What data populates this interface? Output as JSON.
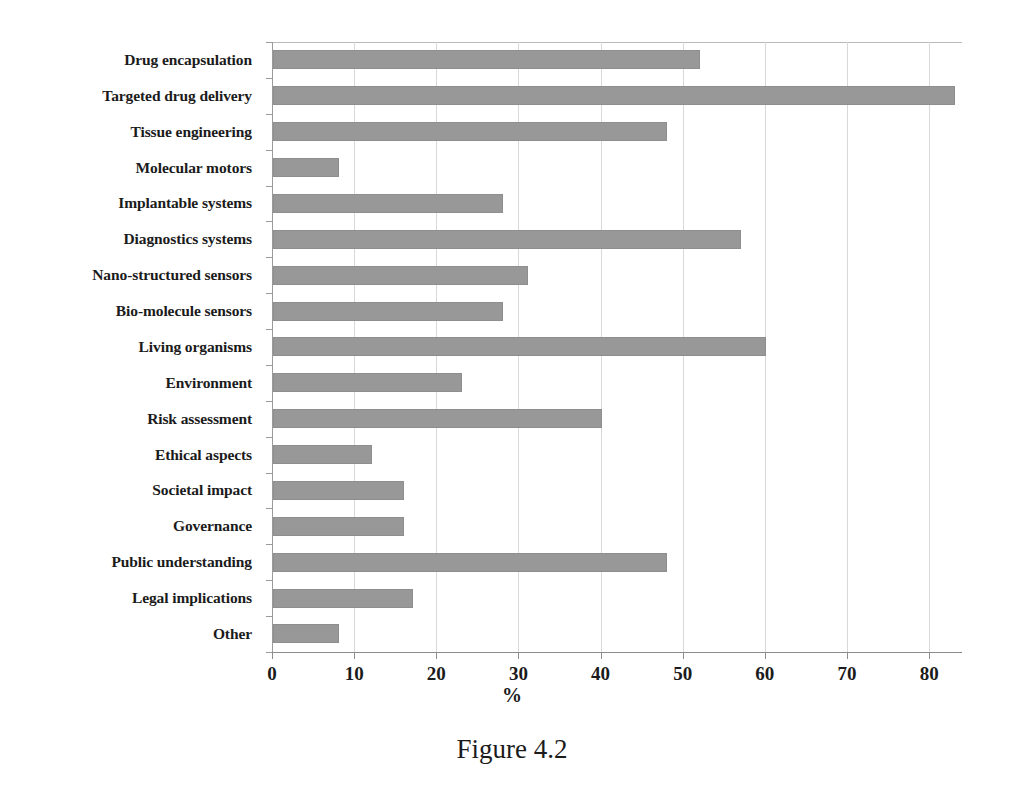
{
  "figure": {
    "caption": "Figure 4.2",
    "axis_title": "%"
  },
  "chart_data": {
    "type": "bar",
    "orientation": "horizontal",
    "title": "",
    "subtitle": "",
    "xlabel": "%",
    "ylabel": "",
    "xlim": [
      0,
      84
    ],
    "xticks": [
      0,
      10,
      20,
      30,
      40,
      50,
      60,
      70,
      80
    ],
    "xtick_labels": [
      "0",
      "10",
      "20",
      "30",
      "40",
      "50",
      "60",
      "70",
      "80"
    ],
    "grid": "vertical",
    "legend": "none",
    "bar_color": "#989898",
    "bar_edge_color": "#8e8e8e",
    "categories": [
      "Drug encapsulation",
      "Targeted drug delivery",
      "Tissue engineering",
      "Molecular motors",
      "Implantable systems",
      "Diagnostics systems",
      "Nano-structured sensors",
      "Bio-molecule sensors",
      "Living organisms",
      "Environment",
      "Risk assessment",
      "Ethical aspects",
      "Societal impact",
      "Governance",
      "Public understanding",
      "Legal implications",
      "Other"
    ],
    "values": [
      52,
      83,
      48,
      8,
      28,
      57,
      31,
      28,
      60,
      23,
      40,
      12,
      16,
      16,
      48,
      17,
      8
    ]
  }
}
